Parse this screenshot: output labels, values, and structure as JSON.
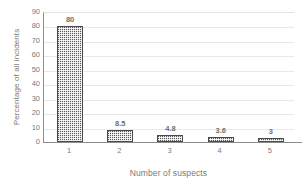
{
  "chart_data": {
    "type": "bar",
    "title": "",
    "subtitle": "",
    "categories": [
      "1",
      "2",
      "3",
      "4",
      "5"
    ],
    "values": [
      80,
      8.5,
      4.8,
      3.6,
      3
    ],
    "value_labels": [
      "80",
      "8.5",
      "4.8",
      "3.6",
      "3"
    ],
    "xlabel": "Number of suspects",
    "ylabel": "Percentage of all incidents",
    "ylim": [
      0,
      90
    ],
    "ytick_step": 10,
    "ytick_labels": [
      "0",
      "10",
      "20",
      "30",
      "40",
      "50",
      "60",
      "70",
      "80",
      "90"
    ],
    "grid": "horizontal",
    "legend": "none",
    "bar_color": "#585858",
    "bar_pattern": "checkered-dither",
    "gridline_color": "#e8e8e8",
    "axis_color": "#8c8c8c",
    "text_color": "#7a7a7a",
    "background": "#ffffff"
  }
}
